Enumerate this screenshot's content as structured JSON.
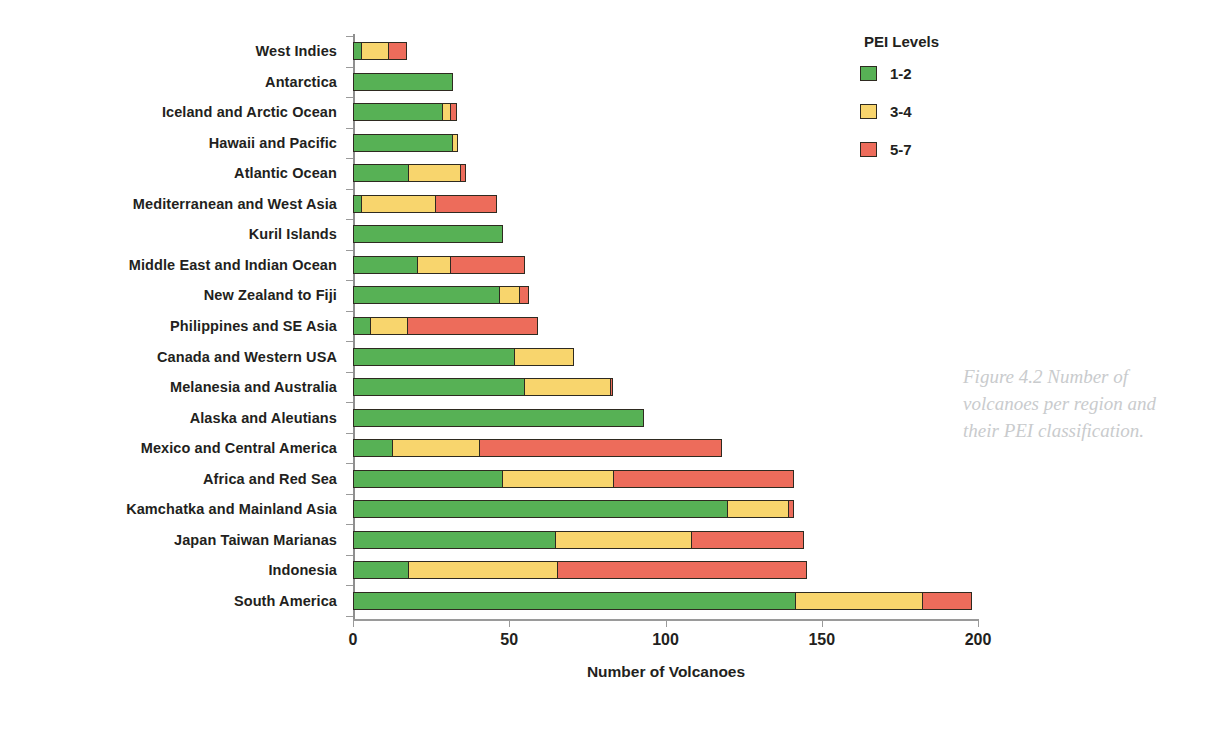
{
  "chart_data": {
    "type": "bar",
    "orientation": "horizontal",
    "stacked": true,
    "title": "",
    "xlabel": "Number of Volcanoes",
    "ylabel": "",
    "xlim": [
      0,
      200
    ],
    "xticks": [
      0,
      50,
      100,
      150,
      200
    ],
    "grid": false,
    "legend_position": "top-right",
    "legend_title": "PEI Levels",
    "categories": [
      "West Indies",
      "Antarctica",
      "Iceland and Arctic Ocean",
      "Hawaii and Pacific",
      "Atlantic Ocean",
      "Mediterranean and West Asia",
      "Kuril Islands",
      "Middle East and Indian Ocean",
      "New Zealand to Fiji",
      "Philippines and SE Asia",
      "Canada and Western USA",
      "Melanesia and Australia",
      "Alaska and Aleutians",
      "Mexico and Central America",
      "Africa and Red Sea",
      "Kamchatka and Mainland Asia",
      "Japan Taiwan Marianas",
      "Indonesia",
      "South America"
    ],
    "series": [
      {
        "name": "1-2",
        "color": "#57b155",
        "values": [
          3,
          32,
          29,
          32,
          18,
          3,
          48,
          21,
          47,
          6,
          52,
          55,
          93,
          13,
          48,
          120,
          65,
          18,
          142
        ]
      },
      {
        "name": "3-4",
        "color": "#f8d56d",
        "values": [
          9,
          0,
          3,
          2,
          17,
          24,
          0,
          11,
          7,
          12,
          19,
          28,
          0,
          28,
          36,
          20,
          44,
          48,
          41
        ]
      },
      {
        "name": "5-7",
        "color": "#ed6c5b",
        "values": [
          6,
          0,
          2,
          0,
          2,
          20,
          0,
          24,
          3,
          42,
          0,
          1,
          0,
          78,
          58,
          2,
          36,
          80,
          16
        ]
      }
    ],
    "totals": [
      18,
      32,
      34,
      34,
      37,
      47,
      48,
      56,
      57,
      60,
      71,
      84,
      93,
      119,
      142,
      142,
      145,
      146,
      199
    ]
  },
  "legend": {
    "title": "PEI Levels",
    "items": [
      {
        "label": "1-2",
        "color": "#57b155"
      },
      {
        "label": "3-4",
        "color": "#f8d56d"
      },
      {
        "label": "5-7",
        "color": "#ed6c5b"
      }
    ]
  },
  "axis": {
    "x_title": "Number of Volcanoes",
    "x_tick_labels": [
      "0",
      "50",
      "100",
      "150",
      "200"
    ]
  },
  "caption": {
    "text": "Figure 4.2 Number of volcanoes per region and their PEI classification."
  },
  "colors": {
    "green": "#57b155",
    "yellow": "#f8d56d",
    "red": "#ed6c5b",
    "outline": "#2e2a20",
    "axis": "#9a9a9a",
    "text": "#231f20",
    "caption": "#c9cbcd"
  }
}
